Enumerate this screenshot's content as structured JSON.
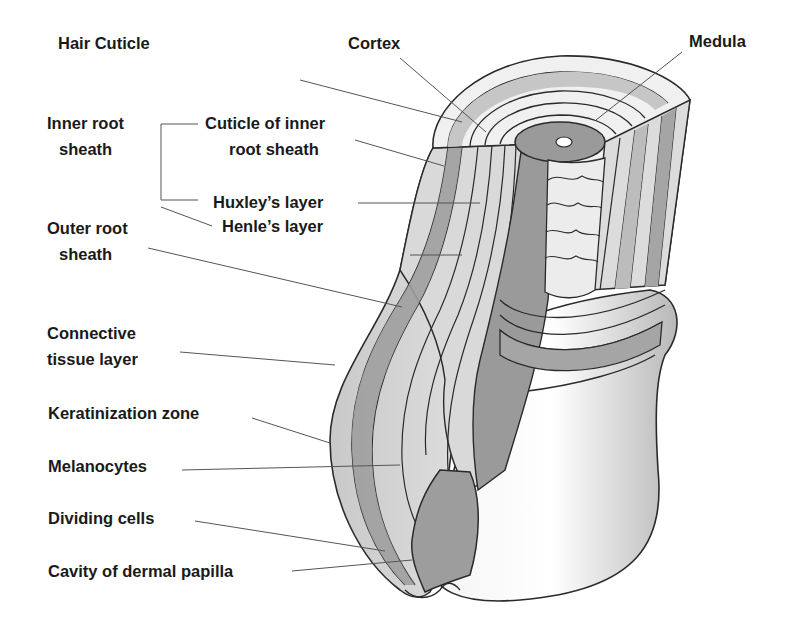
{
  "diagram": {
    "colors": {
      "background": "#ffffff",
      "outline": "#2a2a2a",
      "leader": "#555555",
      "dark_band": "#9a9a9a",
      "mid_band": "#bdbdbd",
      "light_band": "#dcdcdc",
      "bulb": "#c8c8c8"
    },
    "labels": {
      "hair_cuticle": "Hair Cuticle",
      "cortex": "Cortex",
      "medula": "Medula",
      "inner_root_sheath_1": "Inner root",
      "inner_root_sheath_2": "sheath",
      "cuticle_inner_1": "Cuticle of inner",
      "cuticle_inner_2": "root sheath",
      "huxleys_layer": "Huxley’s layer",
      "henles_layer": "Henle’s layer",
      "outer_root_sheath_1": "Outer root",
      "outer_root_sheath_2": "sheath",
      "connective_1": "Connective",
      "connective_2": "tissue layer",
      "keratinization_zone": "Keratinization zone",
      "melanocytes": "Melanocytes",
      "dividing_cells": "Dividing cells",
      "cavity_dermal_papilla": "Cavity of dermal papilla"
    }
  }
}
